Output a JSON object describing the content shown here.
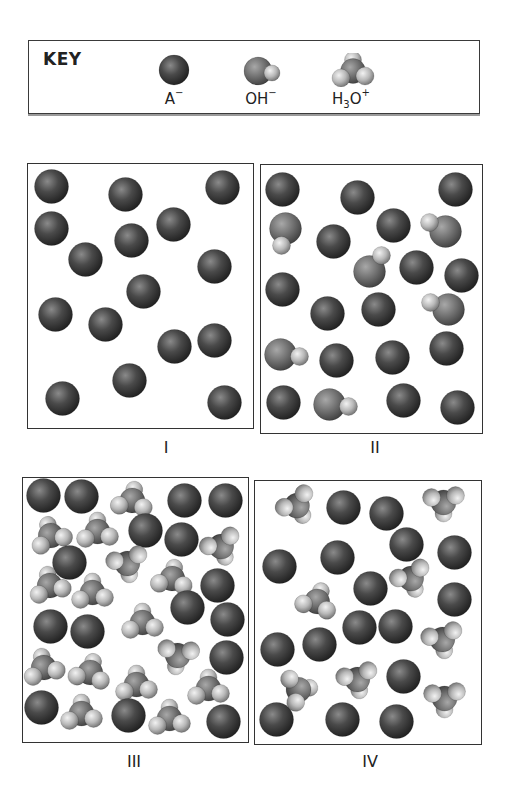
{
  "key": {
    "title": "KEY",
    "items": [
      {
        "species": "A-",
        "label": "A",
        "charge": "−",
        "subscript": "",
        "after_sub": "",
        "type": "anion",
        "x": 110
      },
      {
        "species": "OH-",
        "label": "OH",
        "charge": "−",
        "subscript": "",
        "after_sub": "",
        "type": "hydroxide",
        "x": 197
      },
      {
        "species": "H3O+",
        "label": "H",
        "subscript": "3",
        "after_sub": "O",
        "charge": "+",
        "type": "hydronium",
        "x": 287
      }
    ]
  },
  "colors": {
    "anion": "#3c3c3c",
    "oxygen": "#6a6a6a",
    "hydrogen": "#b9b9b9",
    "border": "#333333"
  },
  "panels": [
    {
      "id": "I",
      "label": "I",
      "box": {
        "x": 27,
        "y": 163,
        "w": 225,
        "h": 264
      },
      "label_pos": {
        "x": 133,
        "y": 438
      },
      "counts": {
        "A-": 15,
        "OH-": 0,
        "H3O+": 0
      },
      "molecules": [
        {
          "t": "A",
          "x": 52,
          "y": 187
        },
        {
          "t": "A",
          "x": 126,
          "y": 195
        },
        {
          "t": "A",
          "x": 223,
          "y": 188
        },
        {
          "t": "A",
          "x": 52,
          "y": 229
        },
        {
          "t": "A",
          "x": 132,
          "y": 241
        },
        {
          "t": "A",
          "x": 174,
          "y": 225
        },
        {
          "t": "A",
          "x": 86,
          "y": 260
        },
        {
          "t": "A",
          "x": 215,
          "y": 267
        },
        {
          "t": "A",
          "x": 144,
          "y": 292
        },
        {
          "t": "A",
          "x": 56,
          "y": 315
        },
        {
          "t": "A",
          "x": 106,
          "y": 325
        },
        {
          "t": "A",
          "x": 175,
          "y": 347
        },
        {
          "t": "A",
          "x": 215,
          "y": 341
        },
        {
          "t": "A",
          "x": 130,
          "y": 381
        },
        {
          "t": "A",
          "x": 63,
          "y": 399
        },
        {
          "t": "A",
          "x": 225,
          "y": 403
        }
      ]
    },
    {
      "id": "II",
      "label": "II",
      "box": {
        "x": 260,
        "y": 164,
        "w": 221,
        "h": 268
      },
      "label_pos": {
        "x": 342,
        "y": 438
      },
      "counts": {
        "A-": 16,
        "OH-": 6,
        "H3O+": 0
      },
      "molecules": [
        {
          "t": "A",
          "x": 283,
          "y": 190
        },
        {
          "t": "A",
          "x": 358,
          "y": 198
        },
        {
          "t": "A",
          "x": 456,
          "y": 190
        },
        {
          "t": "OH",
          "x": 286,
          "y": 229,
          "hx": 282,
          "hy": 246
        },
        {
          "t": "A",
          "x": 334,
          "y": 242
        },
        {
          "t": "A",
          "x": 394,
          "y": 226
        },
        {
          "t": "OH",
          "x": 446,
          "y": 232,
          "hx": 430,
          "hy": 223
        },
        {
          "t": "OH",
          "x": 370,
          "y": 272,
          "hx": 382,
          "hy": 256
        },
        {
          "t": "A",
          "x": 417,
          "y": 268
        },
        {
          "t": "A",
          "x": 462,
          "y": 276
        },
        {
          "t": "A",
          "x": 283,
          "y": 290
        },
        {
          "t": "A",
          "x": 328,
          "y": 314
        },
        {
          "t": "A",
          "x": 379,
          "y": 310
        },
        {
          "t": "OH",
          "x": 449,
          "y": 310,
          "hx": 431,
          "hy": 303
        },
        {
          "t": "OH",
          "x": 281,
          "y": 355,
          "hx": 300,
          "hy": 357
        },
        {
          "t": "A",
          "x": 337,
          "y": 361
        },
        {
          "t": "A",
          "x": 393,
          "y": 358
        },
        {
          "t": "A",
          "x": 447,
          "y": 349
        },
        {
          "t": "A",
          "x": 284,
          "y": 403
        },
        {
          "t": "OH",
          "x": 330,
          "y": 405,
          "hx": 349,
          "hy": 407
        },
        {
          "t": "A",
          "x": 404,
          "y": 401
        },
        {
          "t": "A",
          "x": 458,
          "y": 408
        }
      ]
    },
    {
      "id": "III",
      "label": "III",
      "box": {
        "x": 22,
        "y": 477,
        "w": 225,
        "h": 264
      },
      "label_pos": {
        "x": 101,
        "y": 752
      },
      "counts": {
        "A-": 16,
        "OH-": 0,
        "H3O+": 16
      },
      "molecules": [
        {
          "t": "A",
          "x": 44,
          "y": 496
        },
        {
          "t": "A",
          "x": 82,
          "y": 497
        },
        {
          "t": "H3O",
          "x": 133,
          "y": 500,
          "r": 10
        },
        {
          "t": "A",
          "x": 185,
          "y": 501
        },
        {
          "t": "A",
          "x": 226,
          "y": 501
        },
        {
          "t": "H3O",
          "x": 51,
          "y": 535,
          "r": -15
        },
        {
          "t": "H3O",
          "x": 98,
          "y": 531,
          "r": 0
        },
        {
          "t": "A",
          "x": 146,
          "y": 531
        },
        {
          "t": "A",
          "x": 182,
          "y": 540
        },
        {
          "t": "H3O",
          "x": 222,
          "y": 548,
          "r": 160
        },
        {
          "t": "A",
          "x": 70,
          "y": 563
        },
        {
          "t": "H3O",
          "x": 128,
          "y": 565,
          "r": 170
        },
        {
          "t": "H3O",
          "x": 173,
          "y": 578,
          "r": 10
        },
        {
          "t": "A",
          "x": 218,
          "y": 586
        },
        {
          "t": "H3O",
          "x": 50,
          "y": 585,
          "r": -10
        },
        {
          "t": "H3O",
          "x": 93,
          "y": 592,
          "r": 0
        },
        {
          "t": "A",
          "x": 188,
          "y": 608
        },
        {
          "t": "A",
          "x": 228,
          "y": 620
        },
        {
          "t": "A",
          "x": 51,
          "y": 627
        },
        {
          "t": "A",
          "x": 88,
          "y": 632
        },
        {
          "t": "H3O",
          "x": 143,
          "y": 622,
          "r": 0
        },
        {
          "t": "H3O",
          "x": 178,
          "y": 657,
          "r": 190
        },
        {
          "t": "A",
          "x": 227,
          "y": 658
        },
        {
          "t": "H3O",
          "x": 44,
          "y": 667,
          "r": -10
        },
        {
          "t": "H3O",
          "x": 91,
          "y": 672,
          "r": 15
        },
        {
          "t": "H3O",
          "x": 137,
          "y": 684,
          "r": 0
        },
        {
          "t": "H3O",
          "x": 209,
          "y": 688,
          "r": 0
        },
        {
          "t": "A",
          "x": 42,
          "y": 708
        },
        {
          "t": "H3O",
          "x": 82,
          "y": 713,
          "r": 0
        },
        {
          "t": "A",
          "x": 129,
          "y": 716
        },
        {
          "t": "H3O",
          "x": 170,
          "y": 718,
          "r": 0
        },
        {
          "t": "A",
          "x": 224,
          "y": 722
        }
      ]
    },
    {
      "id": "IV",
      "label": "IV",
      "box": {
        "x": 254,
        "y": 480,
        "w": 226,
        "h": 263
      },
      "label_pos": {
        "x": 337,
        "y": 752
      },
      "counts": {
        "A-": 16,
        "OH-": 0,
        "H3O+": 8
      },
      "molecules": [
        {
          "t": "H3O",
          "x": 298,
          "y": 507,
          "r": 150
        },
        {
          "t": "A",
          "x": 344,
          "y": 508
        },
        {
          "t": "A",
          "x": 387,
          "y": 514
        },
        {
          "t": "H3O",
          "x": 444,
          "y": 504,
          "r": 180
        },
        {
          "t": "A",
          "x": 407,
          "y": 545
        },
        {
          "t": "A",
          "x": 455,
          "y": 553
        },
        {
          "t": "A",
          "x": 280,
          "y": 567
        },
        {
          "t": "A",
          "x": 338,
          "y": 558
        },
        {
          "t": "A",
          "x": 371,
          "y": 589
        },
        {
          "t": "H3O",
          "x": 412,
          "y": 580,
          "r": 160
        },
        {
          "t": "A",
          "x": 455,
          "y": 600
        },
        {
          "t": "H3O",
          "x": 318,
          "y": 601,
          "r": 20
        },
        {
          "t": "A",
          "x": 360,
          "y": 628
        },
        {
          "t": "A",
          "x": 396,
          "y": 627
        },
        {
          "t": "H3O",
          "x": 443,
          "y": 641,
          "r": 170
        },
        {
          "t": "A",
          "x": 278,
          "y": 650
        },
        {
          "t": "A",
          "x": 320,
          "y": 645
        },
        {
          "t": "H3O",
          "x": 300,
          "y": 690,
          "r": 80
        },
        {
          "t": "H3O",
          "x": 358,
          "y": 681,
          "r": 170
        },
        {
          "t": "A",
          "x": 404,
          "y": 677
        },
        {
          "t": "H3O",
          "x": 445,
          "y": 700,
          "r": 180
        },
        {
          "t": "A",
          "x": 277,
          "y": 720
        },
        {
          "t": "A",
          "x": 343,
          "y": 720
        },
        {
          "t": "A",
          "x": 397,
          "y": 722
        }
      ]
    }
  ]
}
